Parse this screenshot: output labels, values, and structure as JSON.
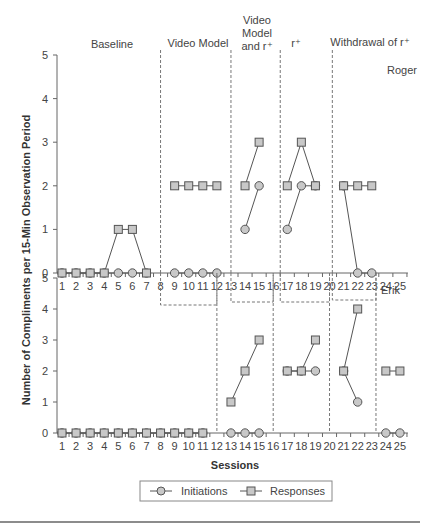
{
  "chart_data": {
    "type": "line",
    "title": "",
    "xlabel": "Sessions",
    "ylabel": "Number of Compliments per 15-Min Observation Period",
    "x_ticks": [
      1,
      2,
      3,
      4,
      5,
      6,
      7,
      8,
      9,
      10,
      11,
      12,
      13,
      14,
      15,
      16,
      17,
      18,
      19,
      20,
      21,
      22,
      23,
      24,
      25
    ],
    "y_ticks": [
      0,
      1,
      2,
      3,
      4,
      5
    ],
    "ylim": [
      0,
      5
    ],
    "xlim": [
      1,
      25
    ],
    "legend": {
      "placement": "bottom-center",
      "entries": [
        {
          "name": "Initiations",
          "marker": "circle"
        },
        {
          "name": "Responses",
          "marker": "square"
        }
      ]
    },
    "phases": [
      {
        "label_lines": [
          "Baseline"
        ]
      },
      {
        "label_lines": [
          "Video Model"
        ]
      },
      {
        "label_lines": [
          "Video",
          "Model",
          "and r⁺"
        ]
      },
      {
        "label_lines": [
          "r⁺"
        ]
      },
      {
        "label_lines": [
          "Withdrawal of r⁺"
        ]
      }
    ],
    "panels": [
      {
        "participant": "Roger",
        "phase_change_after": [
          8,
          13,
          16.5,
          20.2
        ],
        "series": [
          {
            "name": "Responses",
            "segments": [
              [
                [
                  1,
                  0
                ],
                [
                  2,
                  0
                ],
                [
                  3,
                  0
                ],
                [
                  4,
                  0
                ],
                [
                  5,
                  1
                ],
                [
                  6,
                  1
                ],
                [
                  7,
                  0
                ]
              ],
              [
                [
                  9,
                  2
                ],
                [
                  10,
                  2
                ],
                [
                  11,
                  2
                ],
                [
                  12,
                  2
                ]
              ],
              [
                [
                  14,
                  2
                ],
                [
                  15,
                  3
                ]
              ],
              [
                [
                  17,
                  2
                ],
                [
                  18,
                  3
                ],
                [
                  19,
                  2
                ]
              ],
              [
                [
                  21,
                  2
                ],
                [
                  22,
                  2
                ],
                [
                  23,
                  2
                ]
              ]
            ]
          },
          {
            "name": "Initiations",
            "segments": [
              [
                [
                  1,
                  0
                ],
                [
                  2,
                  0
                ],
                [
                  3,
                  0
                ],
                [
                  4,
                  0
                ],
                [
                  5,
                  0
                ],
                [
                  6,
                  0
                ],
                [
                  7,
                  0
                ]
              ],
              [
                [
                  9,
                  0
                ],
                [
                  10,
                  0
                ],
                [
                  11,
                  0
                ],
                [
                  12,
                  0
                ]
              ],
              [
                [
                  14,
                  1
                ],
                [
                  15,
                  2
                ]
              ],
              [
                [
                  17,
                  1
                ],
                [
                  18,
                  2
                ],
                [
                  19,
                  2
                ]
              ],
              [
                [
                  21,
                  2
                ],
                [
                  22,
                  0
                ],
                [
                  23,
                  0
                ]
              ]
            ]
          }
        ]
      },
      {
        "participant": "Erik",
        "phase_change_after": [
          12,
          16,
          20,
          23.3
        ],
        "series": [
          {
            "name": "Responses",
            "segments": [
              [
                [
                  1,
                  0
                ],
                [
                  2,
                  0
                ],
                [
                  3,
                  0
                ],
                [
                  4,
                  0
                ],
                [
                  5,
                  0
                ],
                [
                  6,
                  0
                ],
                [
                  7,
                  0
                ],
                [
                  8,
                  0
                ],
                [
                  9,
                  0
                ],
                [
                  10,
                  0
                ],
                [
                  11,
                  0
                ]
              ],
              [
                [
                  13,
                  1
                ],
                [
                  14,
                  2
                ],
                [
                  15,
                  3
                ]
              ],
              [
                [
                  17,
                  2
                ],
                [
                  18,
                  2
                ],
                [
                  19,
                  3
                ]
              ],
              [
                [
                  21,
                  2
                ],
                [
                  22,
                  4
                ]
              ],
              [
                [
                  24,
                  2
                ],
                [
                  25,
                  2
                ]
              ]
            ]
          },
          {
            "name": "Initiations",
            "segments": [
              [
                [
                  1,
                  0
                ],
                [
                  2,
                  0
                ],
                [
                  3,
                  0
                ],
                [
                  4,
                  0
                ],
                [
                  5,
                  0
                ],
                [
                  6,
                  0
                ],
                [
                  7,
                  0
                ],
                [
                  8,
                  0
                ],
                [
                  9,
                  0
                ],
                [
                  10,
                  0
                ],
                [
                  11,
                  0
                ]
              ],
              [
                [
                  13,
                  0
                ],
                [
                  14,
                  0
                ],
                [
                  15,
                  0
                ]
              ],
              [
                [
                  17,
                  2
                ],
                [
                  18,
                  2
                ],
                [
                  19,
                  2
                ]
              ],
              [
                [
                  21,
                  2
                ],
                [
                  22,
                  1
                ]
              ],
              [
                [
                  24,
                  0
                ],
                [
                  25,
                  0
                ]
              ]
            ]
          }
        ]
      }
    ]
  }
}
